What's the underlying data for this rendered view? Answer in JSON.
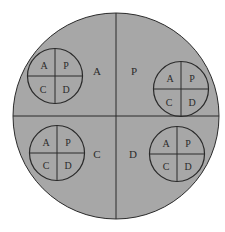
{
  "diagram": {
    "type": "nested-pdca-cycle",
    "colors": {
      "fill": "#a7a7a7",
      "stroke": "#2a2a2a",
      "background": "#ffffff"
    },
    "outer_quadrants": [
      {
        "position": "top-left",
        "label": "A"
      },
      {
        "position": "top-right",
        "label": "P"
      },
      {
        "position": "bottom-left",
        "label": "C"
      },
      {
        "position": "bottom-right",
        "label": "D"
      }
    ],
    "inner_cycles": [
      {
        "position": "top-left",
        "labels": {
          "tl": "A",
          "tr": "P",
          "bl": "C",
          "br": "D"
        }
      },
      {
        "position": "top-right",
        "labels": {
          "tl": "A",
          "tr": "P",
          "bl": "C",
          "br": "D"
        }
      },
      {
        "position": "bottom-left",
        "labels": {
          "tl": "A",
          "tr": "P",
          "bl": "C",
          "br": "D"
        }
      },
      {
        "position": "bottom-right",
        "labels": {
          "tl": "A",
          "tr": "P",
          "bl": "C",
          "br": "D"
        }
      }
    ]
  }
}
